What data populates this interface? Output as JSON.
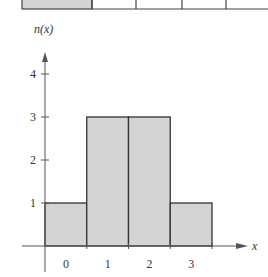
{
  "chart_data": {
    "type": "bar",
    "title": "",
    "xlabel": "x",
    "ylabel": "n(x)",
    "categories": [
      "0",
      "1",
      "2",
      "3"
    ],
    "values": [
      1,
      3,
      3,
      1
    ],
    "yticks": [
      "1",
      "2",
      "3",
      "4"
    ],
    "ylim": [
      0,
      4.5
    ],
    "grid": false,
    "legend": null,
    "bar_color": "#d4d4d4",
    "edge_color": "#333333"
  },
  "top_strip": {
    "cells": 5,
    "first_shaded": true
  }
}
